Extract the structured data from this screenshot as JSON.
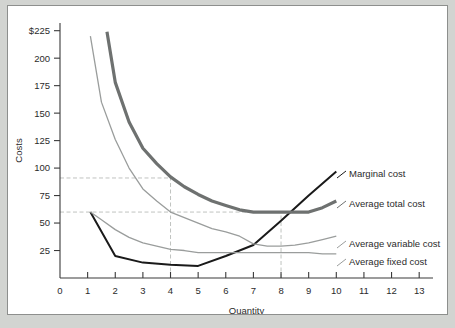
{
  "figure": {
    "background": "#ffffff",
    "page_background": "#d2d4d1",
    "border_color": "#8d8f8d"
  },
  "chart_data": {
    "type": "line",
    "title": "",
    "xlabel": "Quantity",
    "ylabel": "Costs",
    "xlim": [
      0,
      13.5
    ],
    "ylim": [
      0,
      232
    ],
    "xticks": [
      "0",
      "1",
      "2",
      "3",
      "4",
      "5",
      "6",
      "7",
      "8",
      "9",
      "10",
      "11",
      "12",
      "13"
    ],
    "xtick_values": [
      0,
      1,
      2,
      3,
      4,
      5,
      6,
      7,
      8,
      9,
      10,
      11,
      12,
      13
    ],
    "yticks": [
      "25",
      "50",
      "75",
      "100",
      "125",
      "150",
      "175",
      "200",
      "$225"
    ],
    "ytick_values": [
      25,
      50,
      75,
      100,
      125,
      150,
      175,
      200,
      225
    ],
    "grid": false,
    "legend_position": "right-inline-labels",
    "series": [
      {
        "name": "Marginal cost",
        "label": "Marginal cost",
        "color": "#1a1a1a",
        "width": 2.0,
        "label_x": 341,
        "label_y": 168,
        "x": [
          1.1,
          2.0,
          3.0,
          4.0,
          5.0,
          6.0,
          7.0,
          8.0,
          9.0,
          10.0
        ],
        "y": [
          60,
          20,
          14,
          12,
          11,
          20,
          30,
          52,
          75,
          97
        ]
      },
      {
        "name": "Average total cost",
        "label": "Average total cost",
        "color": "#6e7170",
        "width": 3.2,
        "label_x": 341,
        "label_y": 198,
        "x": [
          1.7,
          2.0,
          2.5,
          3.0,
          3.5,
          4.0,
          4.5,
          5.0,
          5.5,
          6.0,
          6.5,
          7.0,
          7.5,
          8.0,
          8.5,
          9.0,
          9.5,
          10.0
        ],
        "y": [
          224,
          178,
          142,
          118,
          104,
          92,
          83,
          76,
          70,
          66,
          62,
          60,
          60,
          60,
          60,
          60,
          64,
          70
        ]
      },
      {
        "name": "Average variable cost",
        "label": "Average variable cost",
        "color": "#9a9d9c",
        "width": 1.3,
        "label_x": 341,
        "label_y": 238,
        "x": [
          1.1,
          1.5,
          2.0,
          2.5,
          3.0,
          3.5,
          4.0,
          4.5,
          5.0,
          5.5,
          6.0,
          6.5,
          7.0,
          7.5,
          8.0,
          8.5,
          9.0,
          9.5,
          10.0
        ],
        "y": [
          220,
          160,
          126,
          100,
          81,
          70,
          60,
          55,
          50,
          45,
          42,
          38,
          31,
          29,
          29,
          30,
          32,
          35,
          38
        ]
      },
      {
        "name": "Average fixed cost",
        "label": "Average fixed cost",
        "color": "#9a9d9c",
        "width": 1.3,
        "label_x": 341,
        "label_y": 256,
        "x": [
          1.1,
          1.5,
          2.0,
          2.5,
          3.0,
          3.5,
          4.0,
          4.5,
          5.0,
          5.5,
          6.0,
          6.5,
          7.0,
          7.5,
          8.0,
          8.5,
          9.0,
          9.5,
          10.0
        ],
        "y": [
          60,
          53,
          44,
          37,
          32,
          29,
          26,
          25,
          23,
          23,
          23,
          23,
          23,
          23,
          23,
          23,
          23,
          22,
          22
        ]
      }
    ],
    "reference_lines": [
      {
        "name": "atc-min-avg-price-h",
        "type": "horizontal",
        "value": 91,
        "x_from": 0,
        "x_to": 4.0
      },
      {
        "name": "atc-min-h",
        "type": "horizontal",
        "value": 60,
        "x_from": 0,
        "x_to": 8.0
      },
      {
        "name": "q4-v",
        "type": "vertical",
        "value": 4.0,
        "y_from": 0,
        "y_to": 91
      },
      {
        "name": "q8-v",
        "type": "vertical",
        "value": 8.0,
        "y_from": 0,
        "y_to": 60
      }
    ],
    "annotations": []
  }
}
